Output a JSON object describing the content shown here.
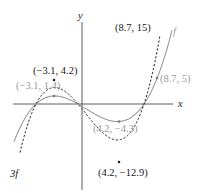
{
  "chart_data": {
    "type": "line",
    "title": "",
    "xlabel": "x",
    "ylabel": "y",
    "grid": false,
    "series": [
      {
        "name": "f",
        "style": "solid",
        "color": "#9a9a9a",
        "points": [
          {
            "x": -3.1,
            "y": 1.4,
            "label": "(−3.1, 1.4)"
          },
          {
            "x": 4.2,
            "y": -4.3,
            "label": "(4.2, −4.3)"
          },
          {
            "x": 8.7,
            "y": 5,
            "label": "(8.7, 5)"
          }
        ]
      },
      {
        "name": "3f",
        "style": "dashed",
        "color": "#1a1a1a",
        "points": [
          {
            "x": -3.1,
            "y": 4.2,
            "label": "(−3.1, 4.2)"
          },
          {
            "x": 4.2,
            "y": -12.9,
            "label": "(4.2, −12.9)"
          },
          {
            "x": 8.7,
            "y": 15,
            "label": "(8.7, 15)"
          }
        ]
      }
    ]
  },
  "labels": {
    "x_axis": "x",
    "y_axis": "y",
    "f_name": "f",
    "threef_name": "3f",
    "f_max": "(−3.1, 1.4)",
    "f_min": "(4.2, −4.3)",
    "f_pt": "(8.7, 5)",
    "g_max": "(−3.1, 4.2)",
    "g_min": "(4.2, −12.9)",
    "g_pt": "(8.7, 15)"
  }
}
